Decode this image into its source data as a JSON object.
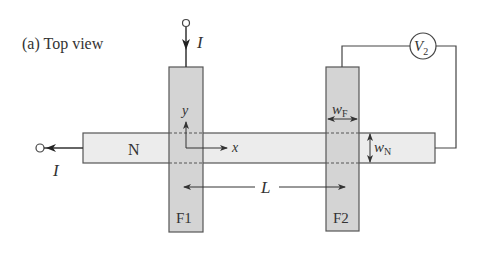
{
  "title": "(a) Top view",
  "labels": {
    "nonmagnet": "N",
    "ferromagnet1": "F1",
    "ferromagnet2": "F2",
    "current_top": "I",
    "current_left": "I",
    "axis_x": "x",
    "axis_y": "y",
    "distance": "L",
    "width_f": "w",
    "width_f_sub": "F",
    "width_n": "w",
    "width_n_sub": "N",
    "voltmeter": "V",
    "voltmeter_sub": "2"
  },
  "colors": {
    "ferromagnet_fill": "#d4d4d4",
    "nonmagnet_fill": "#ececec",
    "stroke": "#444444"
  }
}
